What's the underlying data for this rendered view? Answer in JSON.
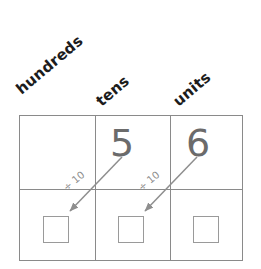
{
  "worksheet": {
    "title": "Place value exchange diagram",
    "columns": [
      {
        "id": "hundreds",
        "label": "hundreds",
        "digit": "",
        "answer_box": ""
      },
      {
        "id": "tens",
        "label": "tens",
        "digit": "5",
        "answer_box": ""
      },
      {
        "id": "units",
        "label": "units",
        "digit": "6",
        "answer_box": ""
      }
    ],
    "exchanges": [
      {
        "id": "tens-to-hundreds",
        "label": "÷ 10"
      },
      {
        "id": "units-to-tens",
        "label": "÷ 10"
      }
    ],
    "colors": {
      "background": "#ffffff",
      "grid_line": "#8a8a8a",
      "header_text": "#1c1c1c",
      "digit_text": "#6b6b6b",
      "answer_box_border": "#9a9a9a",
      "annotation_text": "#8c8c8c",
      "arrow": "#8e8e8e"
    }
  }
}
